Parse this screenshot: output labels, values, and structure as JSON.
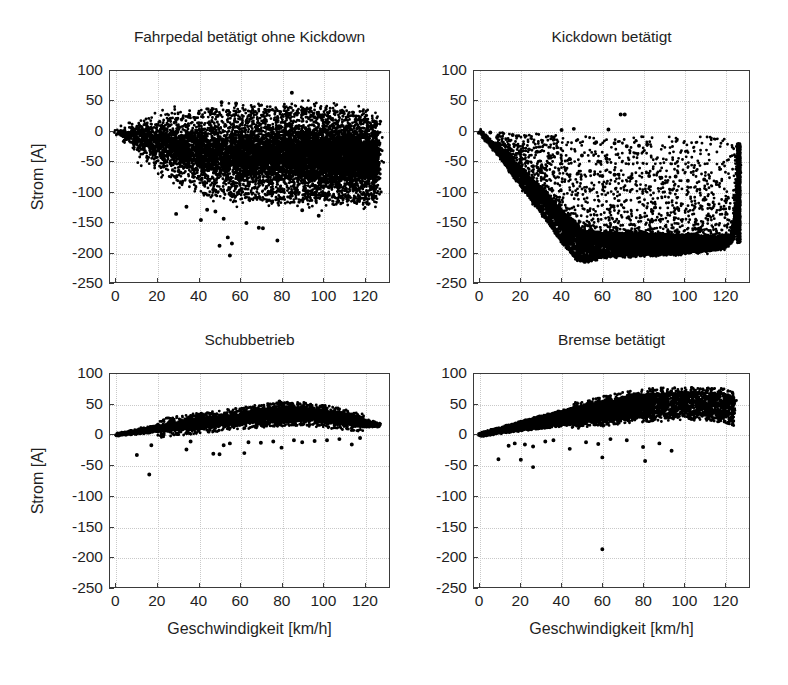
{
  "figure": {
    "background_color": "#ffffff",
    "ink_color": "#000000",
    "axis_color": "#3a3a3a",
    "grid_color": "#c9c9c9",
    "marker_style": "filled-circle"
  },
  "axis_common": {
    "xlabel": "Geschwindigkeit [km/h]",
    "ylabel": "Strom [A]",
    "xlim": [
      -3,
      132
    ],
    "ylim": [
      -250,
      100
    ],
    "xticks": [
      0,
      20,
      40,
      60,
      80,
      100,
      120
    ],
    "xticklabels": [
      "0",
      "20",
      "40",
      "60",
      "80",
      "100",
      "120"
    ],
    "yticks": [
      100,
      50,
      0,
      -50,
      -100,
      -150,
      -200,
      -250
    ],
    "yticklabels": [
      "100",
      "50",
      "0",
      "-50",
      "-100",
      "-150",
      "-200",
      "-250"
    ],
    "grid": true
  },
  "chart_data": [
    {
      "id": "fahrpedal",
      "type": "scatter",
      "title": "Fahrpedal betätigt ohne Kickdown",
      "xlabel": "",
      "ylabel": "Strom [A]",
      "xlim": [
        -3,
        132
      ],
      "ylim": [
        -250,
        100
      ],
      "grid": true,
      "position": "top-left",
      "description": "Dense lens-shaped cloud from 0 to 127 km/h, centred near -35 A, upper envelope rising to about +30 A, lower envelope falling to about -110 A, sparse outliers down to -205 A near 55 km/h and a few points up to +65 A near 85 km/h.",
      "n_points": 9000,
      "cloud": {
        "x_start": 0,
        "x_end": 127,
        "upper_env": [
          [
            0,
            3
          ],
          [
            10,
            15
          ],
          [
            25,
            25
          ],
          [
            50,
            30
          ],
          [
            80,
            32
          ],
          [
            105,
            30
          ],
          [
            120,
            22
          ],
          [
            127,
            14
          ]
        ],
        "lower_env": [
          [
            0,
            -4
          ],
          [
            10,
            -35
          ],
          [
            25,
            -70
          ],
          [
            45,
            -100
          ],
          [
            70,
            -108
          ],
          [
            100,
            -110
          ],
          [
            120,
            -112
          ],
          [
            127,
            -105
          ]
        ]
      },
      "outliers": [
        [
          51,
          48
        ],
        [
          58,
          46
        ],
        [
          85,
          64
        ],
        [
          40,
          30
        ],
        [
          46,
          34
        ],
        [
          35,
          24
        ],
        [
          52,
          -145
        ],
        [
          41,
          -147
        ],
        [
          54,
          -176
        ],
        [
          56,
          -186
        ],
        [
          50,
          -190
        ],
        [
          55,
          -206
        ],
        [
          69,
          -160
        ],
        [
          71,
          -161
        ],
        [
          78,
          -181
        ],
        [
          63,
          -152
        ],
        [
          90,
          -131
        ],
        [
          98,
          -140
        ],
        [
          29,
          -137
        ],
        [
          34,
          -125
        ],
        [
          44,
          -130
        ],
        [
          48,
          -133
        ]
      ]
    },
    {
      "id": "kickdown",
      "type": "scatter",
      "title": "Kickdown betätigt",
      "xlabel": "",
      "ylabel": "",
      "xlim": [
        -3,
        132
      ],
      "ylim": [
        -250,
        100
      ],
      "grid": true,
      "position": "top-right",
      "description": "Sharp diagonal lower boundary descending from 0 A at 0 km/h to about -212 A at 50 km/h, then a broad band between -150 A and -210 A out to 120 km/h, with a steep vertical rise at about 127 km/h reaching -20 A; scattered points fill the region above the boundary up to 0 A; one small isolated cluster near (70, 28).",
      "n_points": 7000,
      "boundary": [
        [
          0,
          0
        ],
        [
          10,
          -42
        ],
        [
          20,
          -88
        ],
        [
          30,
          -132
        ],
        [
          40,
          -180
        ],
        [
          47,
          -208
        ],
        [
          52,
          -212
        ],
        [
          60,
          -205
        ],
        [
          80,
          -202
        ],
        [
          100,
          -200
        ],
        [
          118,
          -192
        ],
        [
          124,
          -180
        ],
        [
          126,
          -120
        ],
        [
          127,
          -55
        ],
        [
          127.5,
          -20
        ]
      ],
      "band_upper": [
        [
          0,
          -2
        ],
        [
          10,
          -30
        ],
        [
          20,
          -62
        ],
        [
          30,
          -95
        ],
        [
          40,
          -130
        ],
        [
          50,
          -165
        ],
        [
          60,
          -168
        ],
        [
          80,
          -170
        ],
        [
          100,
          -172
        ],
        [
          118,
          -175
        ],
        [
          125,
          -172
        ],
        [
          127,
          -30
        ]
      ],
      "outliers": [
        [
          69,
          28
        ],
        [
          71,
          28
        ],
        [
          40,
          2
        ],
        [
          46,
          4
        ],
        [
          63,
          3
        ],
        [
          16,
          -6
        ],
        [
          18,
          -8
        ],
        [
          5,
          -2
        ],
        [
          57,
          -18
        ],
        [
          66,
          -20
        ],
        [
          72,
          -25
        ],
        [
          78,
          -24
        ],
        [
          82,
          -22
        ],
        [
          24,
          -30
        ],
        [
          28,
          -34
        ],
        [
          34,
          -41
        ],
        [
          38,
          -36
        ],
        [
          44,
          -46
        ],
        [
          50,
          -40
        ],
        [
          58,
          -50
        ],
        [
          62,
          -45
        ],
        [
          20,
          -52
        ],
        [
          26,
          -58
        ],
        [
          32,
          -62
        ],
        [
          36,
          -68
        ],
        [
          42,
          -63
        ],
        [
          48,
          -70
        ],
        [
          54,
          -66
        ],
        [
          60,
          -74
        ],
        [
          66,
          -72
        ],
        [
          74,
          -78
        ],
        [
          83,
          -74
        ],
        [
          89,
          -77
        ],
        [
          96,
          -75
        ],
        [
          102,
          -82
        ],
        [
          110,
          -80
        ],
        [
          116,
          -84
        ]
      ]
    },
    {
      "id": "schubbetrieb",
      "type": "scatter",
      "title": "Schubbetrieb",
      "xlabel": "Geschwindigkeit [km/h]",
      "ylabel": "Strom [A]",
      "xlim": [
        -3,
        132
      ],
      "ylim": [
        -250,
        100
      ],
      "grid": true,
      "position": "bottom-left",
      "description": "Narrow arched band starting at 0 A near 0 km/h, rising to a peak of roughly +30 to +40 A between 75 and 95 km/h, then tapering back to about +15 A at 127 km/h; upper edge reaches about +55 A near 80 km/h; a handful of negative outliers between -15 A and -65 A.",
      "n_points": 8000,
      "band_center": [
        [
          0,
          0
        ],
        [
          10,
          5
        ],
        [
          20,
          10
        ],
        [
          30,
          15
        ],
        [
          40,
          19
        ],
        [
          50,
          23
        ],
        [
          60,
          27
        ],
        [
          70,
          31
        ],
        [
          80,
          34
        ],
        [
          90,
          34
        ],
        [
          100,
          31
        ],
        [
          110,
          25
        ],
        [
          120,
          19
        ],
        [
          127,
          16
        ]
      ],
      "band_halfwidth": [
        [
          0,
          2
        ],
        [
          20,
          5
        ],
        [
          40,
          7
        ],
        [
          60,
          8
        ],
        [
          80,
          10
        ],
        [
          100,
          9
        ],
        [
          120,
          5
        ],
        [
          127,
          3
        ]
      ],
      "outliers": [
        [
          10,
          -33
        ],
        [
          16,
          -65
        ],
        [
          17,
          -17
        ],
        [
          34,
          -24
        ],
        [
          36,
          -11
        ],
        [
          47,
          -31
        ],
        [
          50,
          -32
        ],
        [
          52,
          -17
        ],
        [
          55,
          -14
        ],
        [
          62,
          -30
        ],
        [
          64,
          -12
        ],
        [
          70,
          -13
        ],
        [
          76,
          -11
        ],
        [
          80,
          -21
        ],
        [
          86,
          -9
        ],
        [
          90,
          -12
        ],
        [
          96,
          -10
        ],
        [
          102,
          -9
        ],
        [
          108,
          -7
        ],
        [
          114,
          -16
        ],
        [
          118,
          -5
        ],
        [
          81,
          50
        ],
        [
          79,
          55
        ],
        [
          84,
          47
        ]
      ]
    },
    {
      "id": "bremse",
      "type": "scatter",
      "title": "Bremse betätigt",
      "xlabel": "Geschwindigkeit [km/h]",
      "ylabel": "",
      "xlim": [
        -3,
        132
      ],
      "ylim": [
        -250,
        100
      ],
      "grid": true,
      "position": "bottom-right",
      "description": "Wedge-shaped band widening from 0 A at 0 km/h up to roughly +25 to +70 A by 90 km/h, then becoming sparse and scattered between +20 A and +70 A out to 125 km/h; a few negative outliers near -40 to -55 A and one far outlier at about (60, -188).",
      "n_points": 6500,
      "band_upper": [
        [
          0,
          3
        ],
        [
          10,
          12
        ],
        [
          20,
          22
        ],
        [
          30,
          31
        ],
        [
          40,
          40
        ],
        [
          50,
          48
        ],
        [
          60,
          55
        ],
        [
          70,
          62
        ],
        [
          80,
          67
        ],
        [
          90,
          70
        ],
        [
          100,
          70
        ],
        [
          110,
          70
        ],
        [
          120,
          68
        ],
        [
          125,
          62
        ]
      ],
      "band_lower": [
        [
          0,
          -3
        ],
        [
          10,
          2
        ],
        [
          20,
          6
        ],
        [
          30,
          10
        ],
        [
          40,
          14
        ],
        [
          50,
          17
        ],
        [
          60,
          20
        ],
        [
          70,
          24
        ],
        [
          80,
          27
        ],
        [
          90,
          28
        ],
        [
          100,
          30
        ],
        [
          110,
          30
        ],
        [
          120,
          26
        ],
        [
          125,
          20
        ]
      ],
      "outliers": [
        [
          9,
          -40
        ],
        [
          20,
          -41
        ],
        [
          26,
          -53
        ],
        [
          14,
          -18
        ],
        [
          17,
          -14
        ],
        [
          22,
          -16
        ],
        [
          26,
          -19
        ],
        [
          32,
          -11
        ],
        [
          36,
          -9
        ],
        [
          44,
          -23
        ],
        [
          52,
          -12
        ],
        [
          58,
          -15
        ],
        [
          60,
          -37
        ],
        [
          64,
          -7
        ],
        [
          72,
          -9
        ],
        [
          80,
          -20
        ],
        [
          81,
          -43
        ],
        [
          88,
          -14
        ],
        [
          94,
          -26
        ],
        [
          60,
          -188
        ],
        [
          104,
          26
        ],
        [
          112,
          30
        ],
        [
          120,
          22
        ],
        [
          124,
          17
        ]
      ]
    }
  ]
}
